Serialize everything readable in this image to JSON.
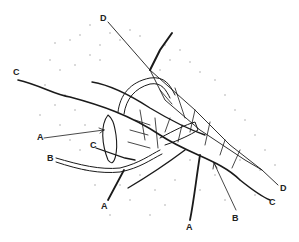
{
  "figure": {
    "labels": [
      {
        "id": "D-top",
        "text": "D",
        "x": 100,
        "y": 14
      },
      {
        "id": "C-left",
        "text": "C",
        "x": 13,
        "y": 68
      },
      {
        "id": "A-left",
        "text": "A",
        "x": 37,
        "y": 133
      },
      {
        "id": "B-left",
        "text": "B",
        "x": 47,
        "y": 154
      },
      {
        "id": "C-mid",
        "text": "C",
        "x": 90,
        "y": 141
      },
      {
        "id": "A-bottom-left",
        "text": "A",
        "x": 101,
        "y": 202
      },
      {
        "id": "A-bottom-mid",
        "text": "A",
        "x": 186,
        "y": 223
      },
      {
        "id": "B-right",
        "text": "B",
        "x": 232,
        "y": 214
      },
      {
        "id": "C-right",
        "text": "C",
        "x": 269,
        "y": 198
      },
      {
        "id": "D-right",
        "text": "D",
        "x": 280,
        "y": 184
      }
    ],
    "colors": {
      "ink": "#1a1a1a",
      "background": "#ffffff",
      "stipple": "#9a9a9a"
    }
  }
}
